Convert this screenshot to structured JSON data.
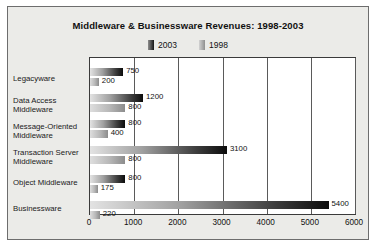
{
  "chart_data": {
    "type": "bar",
    "orientation": "horizontal",
    "title": "Middleware & Businessware Revenues: 1998-2003",
    "xlabel": "",
    "ylabel": "",
    "xlim": [
      0,
      6000
    ],
    "xticks": [
      0,
      1000,
      2000,
      3000,
      4000,
      5000,
      6000
    ],
    "grid": true,
    "legend_position": "top-center",
    "categories": [
      "Legacyware",
      "Data Access\nMiddleware",
      "Message-Oriented\nMiddleware",
      "Transaction Server\nMiddleware",
      "Object Middleware",
      "Businessware"
    ],
    "series": [
      {
        "name": "2003",
        "color": "#111111",
        "values": [
          750,
          1200,
          800,
          3100,
          800,
          5400
        ],
        "labels": [
          "750",
          "1200",
          "800",
          "3100",
          "800",
          "5400"
        ]
      },
      {
        "name": "1998",
        "color": "#b0b0b0",
        "values": [
          200,
          800,
          400,
          800,
          175,
          220
        ],
        "labels": [
          "200",
          "800",
          "400",
          "800",
          "175",
          "220"
        ]
      }
    ]
  },
  "legend": {
    "entries": [
      {
        "label": "2003"
      },
      {
        "label": "1998"
      }
    ]
  },
  "axis": {
    "tick_labels": [
      "0",
      "1000",
      "2000",
      "3000",
      "4000",
      "5000",
      "6000"
    ]
  },
  "colors": {
    "frame_background": "#ebebe8",
    "plot_background": "#ffffff",
    "border": "#6d6d6d",
    "gridline": "#5a5a5a",
    "text": "#111111",
    "series_2003": "#111111",
    "series_1998": "#b0b0b0"
  }
}
